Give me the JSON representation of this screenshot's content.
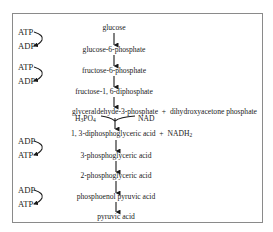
{
  "diagram": {
    "steps": [
      {
        "id": "glucose",
        "label": "glucose"
      },
      {
        "id": "g6p",
        "label": "glucose-6-phosphate"
      },
      {
        "id": "f6p",
        "label": "fructose-6-phosphate"
      },
      {
        "id": "f16dp",
        "label": "fructose-1, 6-diphosphate"
      },
      {
        "id": "g3p_split",
        "label": "glyceraldehyde-3-phosphate  +  dihydroxyacetone phosphate"
      },
      {
        "id": "dpga",
        "label": "1, 3-diphosphoglyceric acid  +  NADH"
      },
      {
        "id": "pga3",
        "label": "3-phosphoglyceric acid"
      },
      {
        "id": "pga2",
        "label": "2-phosphoglyceric acid"
      },
      {
        "id": "pep",
        "label": "phosphoenol pyruvic acid"
      },
      {
        "id": "pyruvate",
        "label": "pyruvic acid"
      }
    ],
    "dpga_subscript": "2",
    "side_inputs": {
      "left": "H",
      "left_sub1": "3",
      "left_mid": "PO",
      "left_sub2": "4",
      "right": "NAD"
    },
    "energy_pairs": [
      {
        "top": "ATP",
        "bottom": "ADP",
        "step": "glucose to glucose-6-phosphate"
      },
      {
        "top": "ATP",
        "bottom": "ADP",
        "step": "fructose-6-phosphate to fructose-1,6-diphosphate"
      },
      {
        "top": "ADP",
        "bottom": "ATP",
        "step": "1,3-diphosphoglyceric acid to 3-phosphoglyceric acid"
      },
      {
        "top": "ADP",
        "bottom": "ATP",
        "step": "phosphoenol pyruvic acid to pyruvic acid"
      }
    ]
  }
}
